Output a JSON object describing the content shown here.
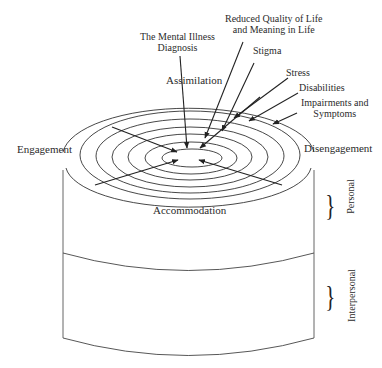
{
  "diagram": {
    "type": "concentric-cylinder",
    "center_labels": {
      "top_left": [
        "The Mental Illness",
        "Diagnosis"
      ],
      "assimilation": "Assimilation",
      "accommodation": "Accommodation",
      "engagement": "Engagement",
      "disengagement": "Disengagement"
    },
    "ring_labels": [
      {
        "id": "reduced_quality",
        "lines": [
          "Reduced Quality of Life",
          "and Meaning in Life"
        ]
      },
      {
        "id": "stigma",
        "lines": [
          "Stigma"
        ]
      },
      {
        "id": "stress",
        "lines": [
          "Stress"
        ]
      },
      {
        "id": "disabilities",
        "lines": [
          "Disabilities"
        ]
      },
      {
        "id": "impairments",
        "lines": [
          "Impairments and",
          "Symptoms"
        ]
      }
    ],
    "layers": [
      {
        "id": "personal",
        "label": "Personal"
      },
      {
        "id": "interpersonal",
        "label": "Interpersonal"
      }
    ],
    "ring_count": 7,
    "line_color": "#333333"
  }
}
